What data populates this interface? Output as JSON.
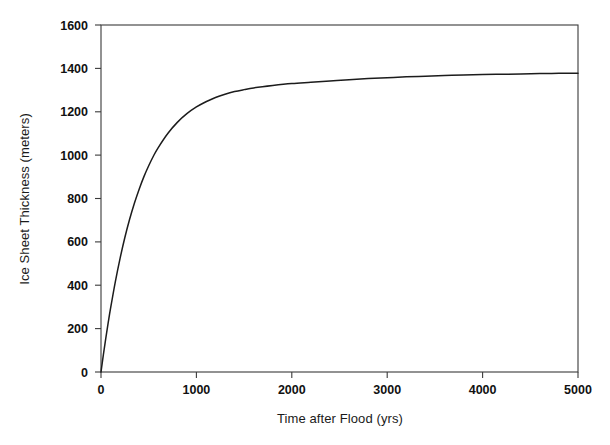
{
  "chart_data": {
    "type": "line",
    "title": "",
    "subtitle": "",
    "xlabel": "Time after Flood (yrs)",
    "ylabel": "Ice Sheet Thickness (meters)",
    "xlim": [
      0,
      5000
    ],
    "ylim": [
      0,
      1600
    ],
    "xticks": [
      0,
      1000,
      2000,
      3000,
      4000,
      5000
    ],
    "yticks": [
      0,
      200,
      400,
      600,
      800,
      1000,
      1200,
      1400,
      1600
    ],
    "xtick_labels": [
      "0",
      "1000",
      "2000",
      "3000",
      "4000",
      "5000"
    ],
    "ytick_labels": [
      "0",
      "200",
      "400",
      "600",
      "800",
      "1000",
      "1200",
      "1400",
      "1600"
    ],
    "grid": false,
    "legend": false,
    "legend_position": "none",
    "line_color": "#1c1c1c",
    "background_color": "#ffffff",
    "axis_color": "#3a3a3a",
    "series": [
      {
        "name": "Ice Sheet Thickness",
        "x": [
          0,
          25,
          50,
          75,
          100,
          150,
          200,
          250,
          300,
          350,
          400,
          450,
          500,
          550,
          600,
          700,
          800,
          900,
          1000,
          1100,
          1200,
          1300,
          1400,
          1500,
          1600,
          1800,
          2000,
          2200,
          2400,
          2600,
          2800,
          3000,
          3200,
          3400,
          3600,
          3800,
          4000,
          4200,
          4400,
          4600,
          4800,
          5000
        ],
        "values": [
          0,
          80,
          155,
          226,
          293,
          416,
          524,
          620,
          704,
          778,
          843,
          901,
          951,
          996,
          1035,
          1100,
          1151,
          1191,
          1222,
          1246,
          1266,
          1281,
          1293,
          1302,
          1310,
          1321,
          1330,
          1336,
          1342,
          1348,
          1353,
          1357,
          1361,
          1364,
          1367,
          1370,
          1372,
          1373,
          1374,
          1376,
          1377,
          1378
        ]
      }
    ],
    "annotations": []
  },
  "axes": {
    "x_title": "Time after Flood (yrs)",
    "y_title": "Ice Sheet Thickness (meters)"
  }
}
